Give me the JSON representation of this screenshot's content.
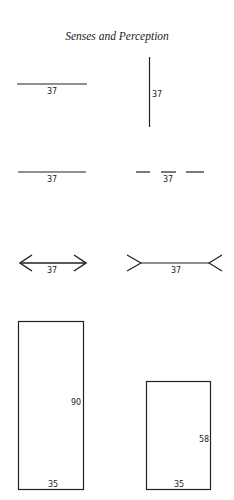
{
  "header": {
    "title": "Senses and Perception"
  },
  "figures": {
    "horizontal_line": {
      "label": "37"
    },
    "vertical_line": {
      "label": "37"
    },
    "solid_line": {
      "label": "37"
    },
    "broken_line": {
      "label": "37"
    },
    "arrows_inward": {
      "label": "37"
    },
    "arrows_outward": {
      "label": "37"
    },
    "tall_rectangle": {
      "height_label": "90",
      "width_label": "35"
    },
    "short_rectangle": {
      "height_label": "58",
      "width_label": "35"
    }
  },
  "colors": {
    "ink": "#222222",
    "background": "#ffffff"
  }
}
